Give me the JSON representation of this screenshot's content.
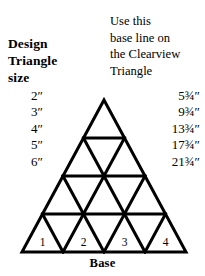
{
  "page": {
    "background_color": "#ffffff",
    "ink_color": "#000000"
  },
  "left_heading": {
    "lines": [
      "Design",
      "Triangle",
      "size"
    ]
  },
  "right_heading": {
    "lines": [
      "Use this",
      "base line on",
      "the Clearview",
      "Triangle"
    ]
  },
  "table": {
    "sizes": [
      "2″",
      "3″",
      "4″",
      "5″",
      "6″"
    ],
    "base_lines": [
      "5¾″",
      "9¾″",
      "13¾″",
      "17¾″",
      "21¾″"
    ]
  },
  "diagram": {
    "rows": 4,
    "bottom_labels": [
      "1",
      "2",
      "3",
      "4"
    ],
    "base_label": "Base",
    "line_color": "#000000"
  }
}
